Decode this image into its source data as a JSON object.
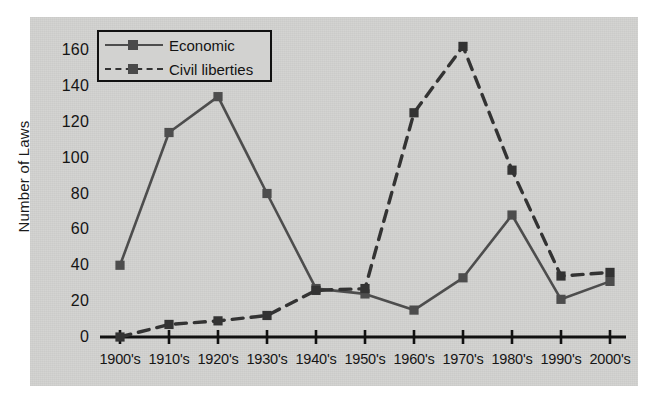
{
  "chart_data": {
    "type": "line",
    "title": "",
    "xlabel": "",
    "ylabel": "Number of Laws",
    "categories": [
      "1900's",
      "1910's",
      "1920's",
      "1930's",
      "1940's",
      "1950's",
      "1960's",
      "1970's",
      "1980's",
      "1990's",
      "2000's"
    ],
    "ylim": [
      0,
      170
    ],
    "yticks": [
      0,
      20,
      40,
      60,
      80,
      100,
      120,
      140,
      160
    ],
    "grid": false,
    "legend_position": "top-left",
    "series": [
      {
        "name": "Economic",
        "style": "solid",
        "marker": "square",
        "color": "#4d4d4d",
        "values": [
          40,
          114,
          134,
          80,
          27,
          24,
          15,
          33,
          68,
          21,
          31
        ]
      },
      {
        "name": "Civil liberties",
        "style": "dashed",
        "marker": "square",
        "color": "#333333",
        "values": [
          0,
          7,
          9,
          12,
          26,
          27,
          125,
          162,
          93,
          34,
          36
        ]
      }
    ]
  },
  "legend": {
    "entries": [
      {
        "label": "Economic"
      },
      {
        "label": "Civil liberties"
      }
    ]
  },
  "axes": {
    "y_label": "Number of Laws",
    "y_ticks": [
      "0",
      "20",
      "40",
      "60",
      "80",
      "100",
      "120",
      "140",
      "160"
    ],
    "x_ticks": [
      "1900's",
      "1910's",
      "1920's",
      "1930's",
      "1940's",
      "1950's",
      "1960's",
      "1970's",
      "1980's",
      "1990's",
      "2000's"
    ]
  },
  "colors": {
    "panel_background": "#d2d2d0",
    "axis": "#111111",
    "economic_line": "#4d4d4d",
    "civil_liberties_line": "#333333",
    "text": "#151515"
  }
}
